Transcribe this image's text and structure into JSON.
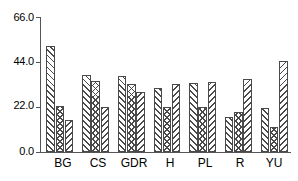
{
  "chart_data": {
    "type": "bar",
    "title": "",
    "subtitle": "",
    "xlabel": "",
    "ylabel": "",
    "categories": [
      "BG",
      "CS",
      "GDR",
      "H",
      "PL",
      "R",
      "YU"
    ],
    "series": [
      {
        "name": "Series 1",
        "pattern": "forward-diagonal-hatch",
        "values": [
          51.8,
          37.7,
          37.2,
          31.3,
          33.8,
          17.1,
          21.5
        ]
      },
      {
        "name": "Series 2",
        "pattern": "cross-hatch",
        "values": [
          22.5,
          34.7,
          33.3,
          22.0,
          22.0,
          19.6,
          12.3
        ]
      },
      {
        "name": "Series 3",
        "pattern": "backward-diagonal-hatch",
        "values": [
          15.7,
          22.0,
          29.3,
          33.3,
          34.2,
          35.7,
          44.6
        ]
      }
    ],
    "ylim": [
      0.0,
      66.0
    ],
    "yticks": [
      0.0,
      22.0,
      44.0,
      66.0
    ],
    "ytick_labels": [
      "0.0",
      "22.0",
      "44.0",
      "66.0"
    ],
    "grid": false,
    "legend": "none",
    "bar_edge_color": "#4a4a4a",
    "axis_color": "#555555",
    "background_color": "#ffffff"
  }
}
